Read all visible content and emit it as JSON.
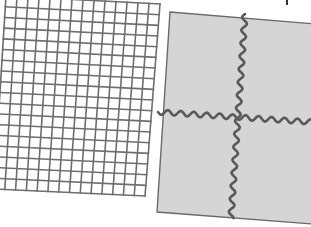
{
  "figure": {
    "width": 311,
    "height": 227,
    "background": "#ffffff",
    "grid_panel": {
      "label": "grid-paper",
      "corners": [
        [
          6,
          -4
        ],
        [
          160,
          4
        ],
        [
          145,
          196
        ],
        [
          -6,
          189
        ]
      ],
      "columns": 14,
      "rows": 18,
      "line_color": "#6e6e6e",
      "fill": "#ffffff",
      "line_width": 1.6
    },
    "cut_panel": {
      "label": "sheet-cut-into-quarters",
      "corners": [
        [
          170,
          12
        ],
        [
          316,
          24
        ],
        [
          313,
          224
        ],
        [
          157,
          212
        ]
      ],
      "fill": "#d5d5d5",
      "border_color": "#6a6a6a",
      "vertical_cut": {
        "x_top": 245,
        "y_top": 14,
        "x_bottom": 231,
        "y_bottom": 218,
        "color": "#595959"
      },
      "horizontal_cut": {
        "x_left": 158,
        "y_left": 112,
        "x_right": 311,
        "y_right": 122,
        "color": "#595959"
      },
      "cross_point": [
        237,
        117
      ]
    },
    "top_right_mark": {
      "x": 286,
      "y": 0,
      "w": 2,
      "h": 5,
      "color": "#333333"
    }
  }
}
